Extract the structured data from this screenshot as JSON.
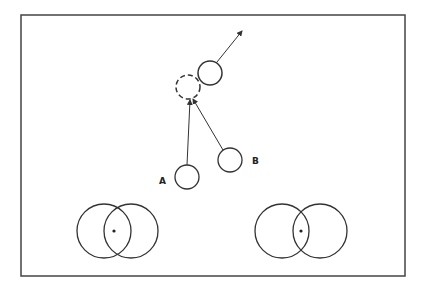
{
  "diagram": {
    "frame": {
      "x": 21,
      "y": 15,
      "w": 384,
      "h": 261,
      "stroke": "#444"
    },
    "stroke_color": "#333",
    "labels": {
      "a": "A",
      "b": "B"
    },
    "circles_top": [
      {
        "id": "moving",
        "cx": 210,
        "cy": 73,
        "r": 12,
        "dashed": false
      },
      {
        "id": "collision-point",
        "cx": 188,
        "cy": 87,
        "r": 12,
        "dashed": true
      },
      {
        "id": "A",
        "cx": 187,
        "cy": 177,
        "r": 12,
        "dashed": false
      },
      {
        "id": "B",
        "cx": 230,
        "cy": 160,
        "r": 12,
        "dashed": false
      }
    ],
    "overlap_pairs": [
      {
        "id": "left",
        "c1": {
          "cx": 104,
          "cy": 231,
          "r": 27
        },
        "c2": {
          "cx": 131,
          "cy": 231,
          "r": 27
        },
        "dot": {
          "x": 114,
          "y": 231
        }
      },
      {
        "id": "right",
        "c1": {
          "cx": 282,
          "cy": 231,
          "r": 27
        },
        "c2": {
          "cx": 320,
          "cy": 231,
          "r": 27
        },
        "dot": {
          "x": 301,
          "y": 231
        }
      }
    ]
  }
}
